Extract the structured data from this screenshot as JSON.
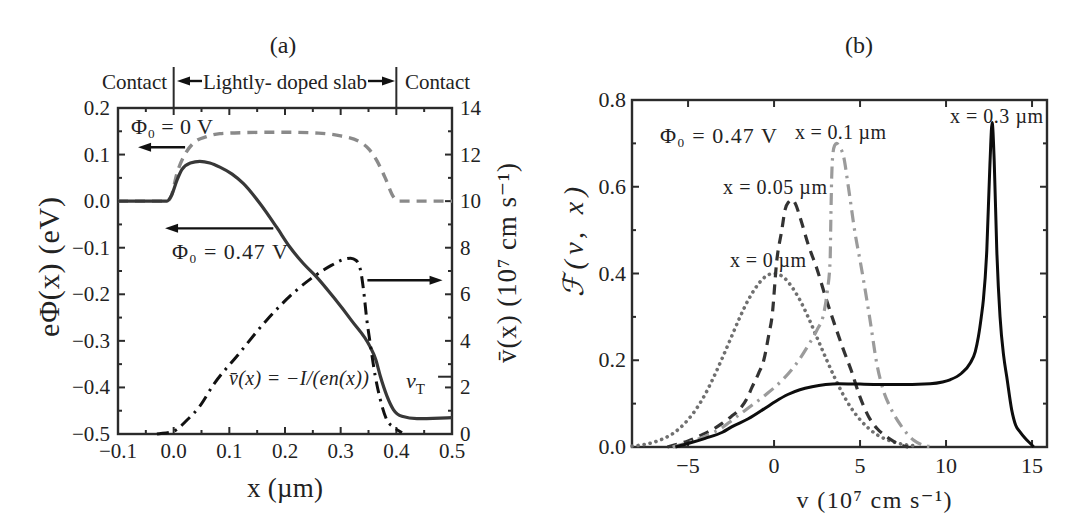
{
  "figure": {
    "panel_count": 2
  },
  "chart_data": [
    {
      "panel": "(a)",
      "type": "line",
      "title": "(a)",
      "xlabel": "x (µm)",
      "ylabel": "eΦ(x) (eV)",
      "ylabel_right": "v̄(x) (10⁷ cm s⁻¹)",
      "xlim": [
        -0.1,
        0.5
      ],
      "ylim": [
        -0.5,
        0.2
      ],
      "ylim_right": [
        0,
        14
      ],
      "xticks": [
        -0.1,
        0.0,
        0.1,
        0.2,
        0.3,
        0.4,
        0.5
      ],
      "xtick_labels": [
        "−0.1",
        "0.0",
        "0.1",
        "0.2",
        "0.3",
        "0.4",
        "0.5"
      ],
      "yticks": [
        0.2,
        0.1,
        0.0,
        -0.1,
        -0.2,
        -0.3,
        -0.4,
        -0.5
      ],
      "ytick_labels": [
        "0.2",
        "0.1",
        "0.0",
        "−0.1",
        "−0.2",
        "−0.3",
        "−0.4",
        "−0.5"
      ],
      "yticks_right": [
        0,
        2,
        4,
        6,
        8,
        10,
        12,
        14
      ],
      "ytick_labels_right": [
        "0",
        "2",
        "4",
        "6",
        "8",
        "10",
        "12",
        "14"
      ],
      "minor_ticks": {
        "x": 0.05,
        "y": 0.05,
        "y_right": 1
      },
      "grid": false,
      "legend": null,
      "regions": {
        "labels": [
          "Contact",
          "Lightly- doped slab",
          "Contact"
        ],
        "boundaries": [
          0.0,
          0.4
        ]
      },
      "series": [
        {
          "name": "Φ₀ = 0 V",
          "axis": "left",
          "style": "dashed",
          "color": "#8a8a8a",
          "width": 3.4,
          "points": [
            [
              -0.1,
              0
            ],
            [
              -0.012,
              0
            ],
            [
              -0.004,
              0.012
            ],
            [
              0.006,
              0.06
            ],
            [
              0.02,
              0.1
            ],
            [
              0.035,
              0.124
            ],
            [
              0.06,
              0.139
            ],
            [
              0.083,
              0.145
            ],
            [
              0.12,
              0.147
            ],
            [
              0.2,
              0.148
            ],
            [
              0.26,
              0.146
            ],
            [
              0.3,
              0.14
            ],
            [
              0.335,
              0.127
            ],
            [
              0.352,
              0.11
            ],
            [
              0.365,
              0.087
            ],
            [
              0.38,
              0.05
            ],
            [
              0.395,
              0.009
            ],
            [
              0.405,
              0.0
            ],
            [
              0.5,
              0.0
            ]
          ]
        },
        {
          "name": "Φ₀ = 0.47 V",
          "axis": "left",
          "style": "solid",
          "color": "#383838",
          "width": 3.2,
          "points": [
            [
              -0.1,
              0
            ],
            [
              -0.012,
              0
            ],
            [
              -0.004,
              0.012
            ],
            [
              0.006,
              0.045
            ],
            [
              0.015,
              0.068
            ],
            [
              0.03,
              0.082
            ],
            [
              0.047,
              0.0855
            ],
            [
              0.065,
              0.082
            ],
            [
              0.083,
              0.073
            ],
            [
              0.105,
              0.058
            ],
            [
              0.125,
              0.038
            ],
            [
              0.155,
              -0.005
            ],
            [
              0.185,
              -0.056
            ],
            [
              0.209,
              -0.099
            ],
            [
              0.233,
              -0.134
            ],
            [
              0.257,
              -0.163
            ],
            [
              0.287,
              -0.206
            ],
            [
              0.32,
              -0.257
            ],
            [
              0.353,
              -0.313
            ],
            [
              0.363,
              -0.34
            ],
            [
              0.371,
              -0.375
            ],
            [
              0.383,
              -0.418
            ],
            [
              0.395,
              -0.448
            ],
            [
              0.41,
              -0.462
            ],
            [
              0.437,
              -0.467
            ],
            [
              0.5,
              -0.465
            ]
          ]
        },
        {
          "name": "v̄(x) = −I/(en(x))",
          "axis": "right",
          "style": "dashdot",
          "color": "#111111",
          "width": 3,
          "points": [
            [
              -0.03,
              0
            ],
            [
              0.0,
              0.12
            ],
            [
              0.024,
              0.6
            ],
            [
              0.047,
              1.2
            ],
            [
              0.071,
              2.1
            ],
            [
              0.117,
              3.44
            ],
            [
              0.167,
              4.89
            ],
            [
              0.221,
              6.18
            ],
            [
              0.251,
              6.75
            ],
            [
              0.284,
              7.25
            ],
            [
              0.303,
              7.48
            ],
            [
              0.318,
              7.55
            ],
            [
              0.328,
              7.45
            ],
            [
              0.336,
              7.0
            ],
            [
              0.341,
              6.2
            ],
            [
              0.347,
              4.9
            ],
            [
              0.353,
              3.9
            ],
            [
              0.362,
              2.5
            ],
            [
              0.371,
              1.5
            ],
            [
              0.383,
              0.6
            ],
            [
              0.395,
              0.3
            ],
            [
              0.41,
              0.05
            ]
          ]
        }
      ],
      "annotations": {
        "phi0_zero": "Φ₀ = 0 V",
        "phi0_047": "Φ₀ = 0.47 V",
        "vbar_formula": "v̄(x) = −I/(en(x))",
        "vT": {
          "symbol": "v",
          "subscript": "T",
          "value": 2.46
        },
        "arrows": [
          {
            "from": [
              0.0205,
              0.1156
            ],
            "to": [
              -0.064,
              0.1156
            ],
            "axis": "left"
          },
          {
            "from": [
              0.179,
              -0.0584
            ],
            "to": [
              -0.0155,
              -0.0584
            ],
            "axis": "left"
          },
          {
            "from": [
              0.348,
              6.6
            ],
            "to": [
              0.483,
              6.6
            ],
            "axis": "right"
          }
        ]
      }
    },
    {
      "panel": "(b)",
      "type": "line",
      "title": "(b)",
      "xlabel": "v (10⁷ cm s⁻¹)",
      "ylabel": "ℱ(v, x)",
      "xlim": [
        -8.26,
        15.87
      ],
      "ylim": [
        0,
        0.8
      ],
      "xticks": [
        -5,
        0,
        5,
        10,
        15
      ],
      "xtick_labels": [
        "−5",
        "0",
        "5",
        "10",
        "15"
      ],
      "yticks": [
        0.0,
        0.2,
        0.4,
        0.6,
        0.8
      ],
      "ytick_labels": [
        "0.0",
        "0.2",
        "0.4",
        "0.6",
        "0.8"
      ],
      "minor_ticks": {
        "x": null,
        "y": 0.1
      },
      "grid": false,
      "legend": null,
      "series": [
        {
          "name": "x = 0 µm",
          "style": "dotted",
          "color": "#707070",
          "width": 3.6,
          "points": [
            [
              -8.26,
              0.002
            ],
            [
              -7.5,
              0.006
            ],
            [
              -7,
              0.011
            ],
            [
              -6.5,
              0.018
            ],
            [
              -6,
              0.028
            ],
            [
              -5.5,
              0.043
            ],
            [
              -5,
              0.063
            ],
            [
              -4.5,
              0.089
            ],
            [
              -4,
              0.122
            ],
            [
              -3.5,
              0.162
            ],
            [
              -3,
              0.206
            ],
            [
              -2.5,
              0.252
            ],
            [
              -2,
              0.298
            ],
            [
              -1.5,
              0.339
            ],
            [
              -1,
              0.371
            ],
            [
              -0.5,
              0.393
            ],
            [
              0,
              0.4
            ],
            [
              0.5,
              0.393
            ],
            [
              1,
              0.371
            ],
            [
              1.5,
              0.339
            ],
            [
              2,
              0.298
            ],
            [
              2.5,
              0.252
            ],
            [
              3,
              0.206
            ],
            [
              3.5,
              0.162
            ],
            [
              4,
              0.122
            ],
            [
              4.5,
              0.089
            ],
            [
              5,
              0.063
            ],
            [
              5.5,
              0.043
            ],
            [
              6,
              0.028
            ],
            [
              6.5,
              0.018
            ],
            [
              7,
              0.011
            ],
            [
              7.5,
              0.006
            ],
            [
              8,
              0.0035
            ],
            [
              8.3,
              0.002
            ]
          ]
        },
        {
          "name": "x = 0.05 µm",
          "style": "dashed",
          "color": "#333333",
          "width": 3.2,
          "points": [
            [
              -6.2,
              0
            ],
            [
              -5.5,
              0.008
            ],
            [
              -5,
              0.014
            ],
            [
              -4.2,
              0.028
            ],
            [
              -3.5,
              0.042
            ],
            [
              -3,
              0.055
            ],
            [
              -2.5,
              0.07
            ],
            [
              -2,
              0.087
            ],
            [
              -1.6,
              0.11
            ],
            [
              -1.28,
              0.138
            ],
            [
              -0.9,
              0.17
            ],
            [
              -0.6,
              0.2
            ],
            [
              -0.3,
              0.26
            ],
            [
              -0.12,
              0.3
            ],
            [
              0.16,
              0.43
            ],
            [
              0.45,
              0.5
            ],
            [
              0.64,
              0.547
            ],
            [
              0.85,
              0.565
            ],
            [
              1.05,
              0.57
            ],
            [
              1.25,
              0.56
            ],
            [
              1.5,
              0.531
            ],
            [
              2.0,
              0.465
            ],
            [
              2.5,
              0.41
            ],
            [
              3.0,
              0.345
            ],
            [
              3.5,
              0.285
            ],
            [
              4.0,
              0.228
            ],
            [
              4.5,
              0.175
            ],
            [
              5.0,
              0.115
            ],
            [
              5.5,
              0.07
            ],
            [
              6.0,
              0.042
            ],
            [
              6.5,
              0.025
            ],
            [
              7.0,
              0.012
            ],
            [
              7.5,
              0.003
            ],
            [
              7.8,
              0
            ]
          ]
        },
        {
          "name": "x = 0.1 µm",
          "style": "dashdot",
          "color": "#9b9b9b",
          "width": 3.2,
          "points": [
            [
              -5.9,
              0
            ],
            [
              -5,
              0.01
            ],
            [
              -4,
              0.025
            ],
            [
              -3,
              0.045
            ],
            [
              -2.44,
              0.062
            ],
            [
              -1.5,
              0.09
            ],
            [
              -0.5,
              0.12
            ],
            [
              0.5,
              0.155
            ],
            [
              1.24,
              0.189
            ],
            [
              2.0,
              0.235
            ],
            [
              2.5,
              0.27
            ],
            [
              2.89,
              0.308
            ],
            [
              3.1,
              0.36
            ],
            [
              3.26,
              0.43
            ],
            [
              3.3,
              0.52
            ],
            [
              3.35,
              0.62
            ],
            [
              3.42,
              0.675
            ],
            [
              3.52,
              0.695
            ],
            [
              3.64,
              0.7
            ],
            [
              3.8,
              0.692
            ],
            [
              4.03,
              0.672
            ],
            [
              4.32,
              0.6
            ],
            [
              4.71,
              0.493
            ],
            [
              5.0,
              0.43
            ],
            [
              5.2,
              0.385
            ],
            [
              5.58,
              0.293
            ],
            [
              5.97,
              0.193
            ],
            [
              6.35,
              0.131
            ],
            [
              6.74,
              0.093
            ],
            [
              7.42,
              0.047
            ],
            [
              8.1,
              0.016
            ],
            [
              8.7,
              0.004
            ],
            [
              9.3,
              0
            ]
          ]
        },
        {
          "name": "x = 0.3 µm",
          "style": "solid",
          "color": "#0d0d0d",
          "width": 3,
          "points": [
            [
              -5.74,
              0
            ],
            [
              -5,
              0.008
            ],
            [
              -4,
              0.02
            ],
            [
              -3,
              0.034
            ],
            [
              -2.44,
              0.047
            ],
            [
              -1.5,
              0.065
            ],
            [
              -0.5,
              0.09
            ],
            [
              0.08,
              0.105
            ],
            [
              0.8,
              0.121
            ],
            [
              1.5,
              0.132
            ],
            [
              2.21,
              0.139
            ],
            [
              3.0,
              0.144
            ],
            [
              3.76,
              0.146
            ],
            [
              5,
              0.145
            ],
            [
              7,
              0.144
            ],
            [
              9.07,
              0.146
            ],
            [
              9.8,
              0.15
            ],
            [
              10.23,
              0.155
            ],
            [
              10.9,
              0.17
            ],
            [
              11.4,
              0.193
            ],
            [
              11.7,
              0.22
            ],
            [
              11.88,
              0.254
            ],
            [
              12.05,
              0.3
            ],
            [
              12.17,
              0.339
            ],
            [
              12.37,
              0.454
            ],
            [
              12.55,
              0.65
            ],
            [
              12.68,
              0.748
            ],
            [
              12.8,
              0.66
            ],
            [
              12.95,
              0.454
            ],
            [
              13.14,
              0.3
            ],
            [
              13.35,
              0.21
            ],
            [
              13.53,
              0.162
            ],
            [
              13.82,
              0.085
            ],
            [
              14.05,
              0.05
            ],
            [
              14.3,
              0.035
            ],
            [
              14.6,
              0.02
            ],
            [
              14.98,
              0.005
            ],
            [
              15.1,
              0
            ]
          ]
        }
      ],
      "annotations": {
        "phi0": "Φ₀ = 0.47 V"
      }
    }
  ]
}
